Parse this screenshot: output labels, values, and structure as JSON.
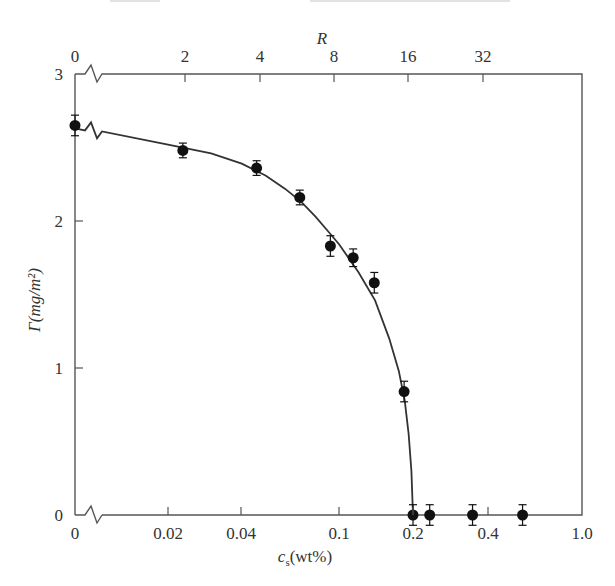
{
  "chart_data": {
    "type": "scatter",
    "title": "",
    "xlabel": "c_s(wt%)",
    "xlabel_main": "c",
    "xlabel_sub": "s",
    "xlabel_unit": "(wt%)",
    "ylabel": "Γ(mg/m²)",
    "top_xlabel": "R",
    "x_scale": "log (broken axis at 0)",
    "x_ticks": [
      {
        "label": "0",
        "value": 0
      },
      {
        "label": "0.02",
        "value": 0.02
      },
      {
        "label": "0.04",
        "value": 0.04
      },
      {
        "label": "0.1",
        "value": 0.1
      },
      {
        "label": "0.2",
        "value": 0.2
      },
      {
        "label": "0.4",
        "value": 0.4
      },
      {
        "label": "1.0",
        "value": 1.0
      }
    ],
    "top_ticks": [
      {
        "label": "0",
        "value": 0
      },
      {
        "label": "2",
        "value": 2
      },
      {
        "label": "4",
        "value": 4
      },
      {
        "label": "8",
        "value": 8
      },
      {
        "label": "16",
        "value": 16
      },
      {
        "label": "32",
        "value": 32
      }
    ],
    "y_ticks": [
      0,
      1,
      2,
      3
    ],
    "ylim": [
      0,
      3
    ],
    "grid": false,
    "legend": null,
    "series": [
      {
        "name": "Γ measurements",
        "marker": "filled-circle",
        "error_bars": true,
        "points": [
          {
            "x": 0,
            "y": 2.65,
            "err": 0.07
          },
          {
            "x": 0.023,
            "y": 2.48,
            "err": 0.05
          },
          {
            "x": 0.046,
            "y": 2.36,
            "err": 0.05
          },
          {
            "x": 0.069,
            "y": 2.16,
            "err": 0.05
          },
          {
            "x": 0.092,
            "y": 1.83,
            "err": 0.07
          },
          {
            "x": 0.114,
            "y": 1.75,
            "err": 0.06
          },
          {
            "x": 0.139,
            "y": 1.58,
            "err": 0.07
          },
          {
            "x": 0.184,
            "y": 0.84,
            "err": 0.07
          },
          {
            "x": 0.2,
            "y": 0.0,
            "err": 0.07
          },
          {
            "x": 0.234,
            "y": 0.0,
            "err": 0.07
          },
          {
            "x": 0.35,
            "y": 0.0,
            "err": 0.07
          },
          {
            "x": 0.56,
            "y": 0.0,
            "err": 0.07
          }
        ]
      },
      {
        "name": "fit curve",
        "type": "line",
        "points": [
          {
            "x": 0,
            "y": 2.63
          },
          {
            "x": 0.02,
            "y": 2.52
          },
          {
            "x": 0.03,
            "y": 2.46
          },
          {
            "x": 0.04,
            "y": 2.39
          },
          {
            "x": 0.05,
            "y": 2.31
          },
          {
            "x": 0.06,
            "y": 2.22
          },
          {
            "x": 0.07,
            "y": 2.13
          },
          {
            "x": 0.08,
            "y": 2.03
          },
          {
            "x": 0.09,
            "y": 1.93
          },
          {
            "x": 0.1,
            "y": 1.84
          },
          {
            "x": 0.12,
            "y": 1.65
          },
          {
            "x": 0.14,
            "y": 1.46
          },
          {
            "x": 0.16,
            "y": 1.2
          },
          {
            "x": 0.175,
            "y": 0.98
          },
          {
            "x": 0.185,
            "y": 0.78
          },
          {
            "x": 0.192,
            "y": 0.55
          },
          {
            "x": 0.197,
            "y": 0.3
          },
          {
            "x": 0.2,
            "y": 0.0
          }
        ]
      }
    ]
  },
  "layout": {
    "plot": {
      "left": 75,
      "right": 582,
      "top": 74,
      "bottom": 515
    },
    "x_pixel": {
      "0": 75,
      "0.02": 168,
      "0.04": 241,
      "0.1": 339,
      "0.2": 413,
      "0.4": 488,
      "1.0": 582
    },
    "top_pixel": {
      "0": 75,
      "2": 185,
      "4": 260,
      "8": 334,
      "16": 408,
      "32": 483
    },
    "colors": {
      "axis": "#555555",
      "marker": "#111111",
      "curve": "#333333",
      "text": "#333333"
    }
  }
}
